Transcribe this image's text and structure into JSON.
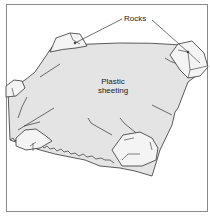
{
  "diagram": {
    "labels": {
      "rocks": "Rocks",
      "sheeting_line1": "Plastic",
      "sheeting_line2": "sheeting"
    },
    "colors": {
      "sheet_fill": "#e4e4e4",
      "rock_fill": "#f4f4f4",
      "line": "#333333",
      "frame": "#8a8a8a"
    },
    "elements": [
      {
        "type": "sheet",
        "name": "plastic-sheeting"
      },
      {
        "type": "rock",
        "name": "rock-top-left"
      },
      {
        "type": "rock",
        "name": "rock-top-right"
      },
      {
        "type": "rock",
        "name": "rock-left"
      },
      {
        "type": "rock",
        "name": "rock-bottom-left"
      },
      {
        "type": "rock",
        "name": "rock-bottom-center"
      }
    ]
  }
}
